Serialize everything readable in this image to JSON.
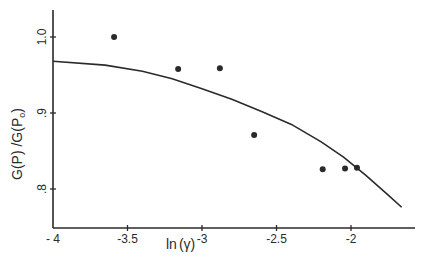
{
  "chart_data": {
    "type": "scatter",
    "title": "",
    "xlabel": "ln(γ)",
    "ylabel": "G(P)/G(P₀)",
    "xlim": [
      -4,
      -1.65
    ],
    "ylim": [
      0.75,
      1.04
    ],
    "grid": false,
    "legend": null,
    "x_ticks": [
      {
        "value": -4,
        "label": "- 4"
      },
      {
        "value": -3.5,
        "label": "-3.5"
      },
      {
        "value": -3,
        "label": "-3"
      },
      {
        "value": -2.5,
        "label": "-2.5"
      },
      {
        "value": -2,
        "label": "-2"
      }
    ],
    "y_ticks": [
      {
        "value": 1.0,
        "label": "1.0"
      },
      {
        "value": 0.9,
        "label": ".9"
      },
      {
        "value": 0.8,
        "label": ".8"
      }
    ],
    "series": [
      {
        "name": "measured",
        "kind": "scatter",
        "x": [
          -3.59,
          -3.16,
          -2.88,
          -2.65,
          -2.19,
          -2.04,
          -1.96
        ],
        "y": [
          1.0,
          0.958,
          0.959,
          0.871,
          0.826,
          0.827,
          0.828
        ]
      },
      {
        "name": "fit",
        "kind": "line",
        "x": [
          -4.0,
          -3.65,
          -3.4,
          -3.2,
          -3.0,
          -2.8,
          -2.6,
          -2.4,
          -2.2,
          -2.05,
          -1.9,
          -1.75,
          -1.66
        ],
        "y": [
          0.968,
          0.963,
          0.955,
          0.945,
          0.932,
          0.918,
          0.902,
          0.885,
          0.862,
          0.842,
          0.818,
          0.792,
          0.776
        ]
      }
    ]
  },
  "axes": {
    "x_title_main": "ln",
    "x_title_paren": "(γ)",
    "y_title": "G(P) /G(P",
    "y_title_sub": "o",
    "y_title_end": ")"
  },
  "colors": {
    "ink": "#2a2a2a",
    "background": "#ffffff"
  }
}
